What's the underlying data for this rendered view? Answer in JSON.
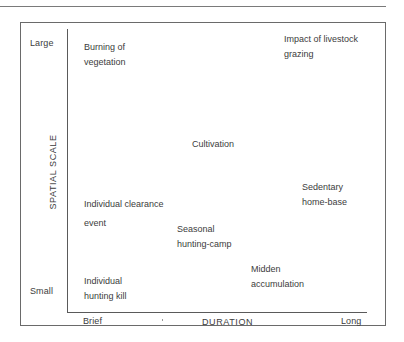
{
  "diagram": {
    "y_axis": {
      "title": "SPATIAL SCALE",
      "high_label": "Large",
      "low_label": "Small"
    },
    "x_axis": {
      "title": "DURATION",
      "low_label": "Brief",
      "high_label": "Long",
      "stray_mark": "'"
    },
    "items": [
      {
        "id": "burning-of-vegetation",
        "lines": [
          "Burning of",
          "vegetation"
        ],
        "duration": "brief",
        "scale": "large"
      },
      {
        "id": "impact-of-livestock-grazing",
        "lines": [
          "Impact of livestock",
          "grazing"
        ],
        "duration": "long",
        "scale": "large"
      },
      {
        "id": "cultivation",
        "lines": [
          "Cultivation"
        ],
        "duration": "medium",
        "scale": "medium-large"
      },
      {
        "id": "sedentary-home-base",
        "lines": [
          "Sedentary",
          "home-base"
        ],
        "duration": "long",
        "scale": "medium"
      },
      {
        "id": "individual-clearance-event",
        "lines": [
          "Individual clearance",
          "event"
        ],
        "duration": "brief",
        "scale": "medium"
      },
      {
        "id": "seasonal-hunting-camp",
        "lines": [
          "Seasonal",
          "hunting-camp"
        ],
        "duration": "medium-brief",
        "scale": "medium-small"
      },
      {
        "id": "midden-accumulation",
        "lines": [
          "Midden",
          "accumulation"
        ],
        "duration": "medium-long",
        "scale": "small"
      },
      {
        "id": "individual-hunting-kill",
        "lines": [
          "Individual",
          "hunting kill"
        ],
        "duration": "brief",
        "scale": "small"
      }
    ]
  }
}
